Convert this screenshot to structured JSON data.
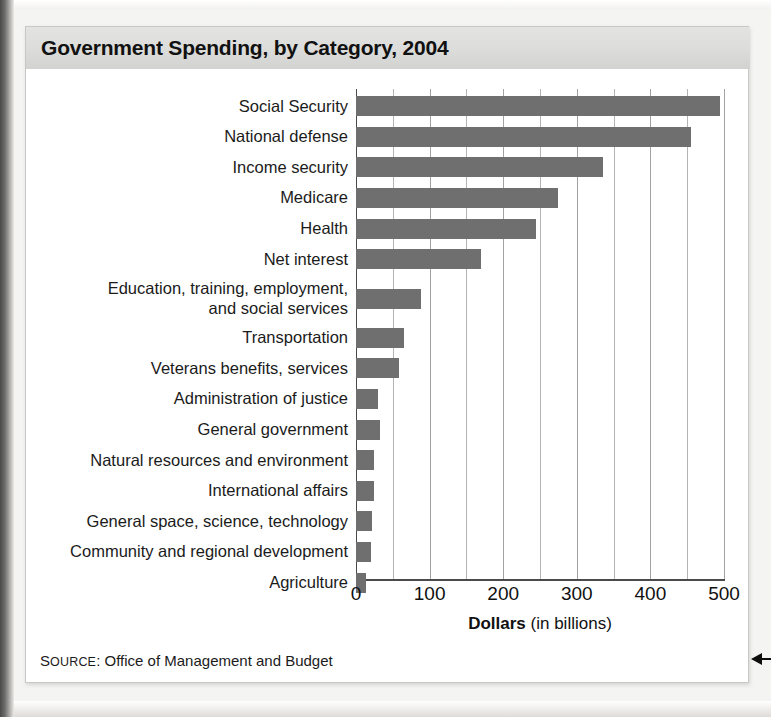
{
  "figure": {
    "title": "Government Spending, by Category, 2004",
    "source_prefix": "S",
    "source_prefix_rest": "OURCE",
    "source_colon": ": ",
    "source_text": "Office of Management and Budget",
    "source_full": "SOURCE: Office of Management and Budget"
  },
  "axis": {
    "x_title_bold": "Dollars",
    "x_title_rest": " (in billions)",
    "tick_labels": [
      "0",
      "100",
      "200",
      "300",
      "400",
      "500"
    ]
  },
  "chart_data": {
    "type": "bar",
    "orientation": "horizontal",
    "title": "Government Spending, by Category, 2004",
    "xlabel": "Dollars (in billions)",
    "ylabel": "",
    "xlim": [
      0,
      500
    ],
    "xticks": [
      0,
      100,
      200,
      300,
      400,
      500
    ],
    "minor_gridline_step": 50,
    "grid": true,
    "legend": "none",
    "bar_color": "#6f6f6f",
    "units": "billions of dollars",
    "categories": [
      "Social Security",
      "National defense",
      "Income security",
      "Medicare",
      "Health",
      "Net interest",
      "Education, training, employment,\nand social services",
      "Transportation",
      "Veterans benefits, services",
      "Administration of justice",
      "General government",
      "Natural resources and environment",
      "International affairs",
      "General space, science, technology",
      "Community and regional development",
      "Agriculture"
    ],
    "values": [
      495,
      455,
      335,
      275,
      245,
      170,
      88,
      65,
      58,
      30,
      33,
      24,
      25,
      22,
      20,
      14
    ],
    "source": "Office of Management and Budget"
  }
}
